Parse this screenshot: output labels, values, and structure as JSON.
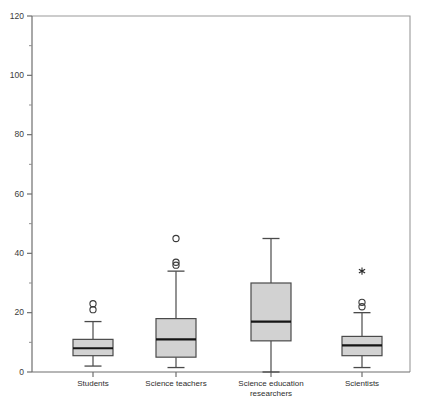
{
  "chart_data": {
    "type": "box",
    "title": "",
    "xlabel": "",
    "ylabel": "",
    "ylim": [
      0,
      120
    ],
    "y_major_ticks": [
      0,
      20,
      40,
      60,
      80,
      100,
      120
    ],
    "y_minor_ticks": [
      10,
      30,
      50,
      70,
      90,
      110
    ],
    "y_tick_labels": [
      "0",
      "20",
      "40",
      "60",
      "80",
      "100",
      "120"
    ],
    "grid": false,
    "legend": "none",
    "categories": [
      "Students",
      "Science teachers",
      "Science education researchers",
      "Scientists"
    ],
    "category_label_lines": [
      [
        "Students"
      ],
      [
        "Science teachers"
      ],
      [
        "Science education",
        "researchers"
      ],
      [
        "Scientists"
      ]
    ],
    "boxes": [
      {
        "name": "Students",
        "whisker_low": 2,
        "q1": 5.5,
        "median": 8,
        "q3": 11,
        "whisker_high": 17,
        "outliers": [
          21,
          23
        ],
        "extremes": []
      },
      {
        "name": "Science teachers",
        "whisker_low": 1.5,
        "q1": 5,
        "median": 11,
        "q3": 18,
        "whisker_high": 34,
        "outliers": [
          36,
          37,
          45
        ],
        "extremes": []
      },
      {
        "name": "Science education researchers",
        "whisker_low": 0,
        "q1": 10.5,
        "median": 17,
        "q3": 30,
        "whisker_high": 45,
        "outliers": [],
        "extremes": []
      },
      {
        "name": "Scientists",
        "whisker_low": 1.5,
        "q1": 5.5,
        "median": 9,
        "q3": 12,
        "whisker_high": 20,
        "outliers": [
          22,
          23.5
        ],
        "extremes": [
          34
        ]
      }
    ],
    "colors": {
      "box_fill": "#d2d2d2",
      "box_stroke": "#4a4a4a",
      "median": "#151515",
      "axis": "#6e6e6e",
      "frame": "#9a9a9a",
      "background": "#ffffff"
    }
  }
}
